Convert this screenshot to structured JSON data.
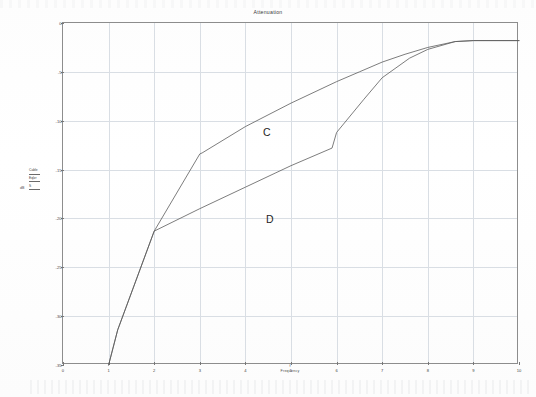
{
  "chart_data": {
    "type": "line",
    "title": "Attenuation",
    "xlabel": "Frequency",
    "xunit": "f",
    "ylabel": "dB",
    "xlim": [
      0,
      10
    ],
    "ylim": [
      -35,
      0
    ],
    "grid": true,
    "legend_position": "left-outside",
    "xticks": [
      "0",
      "1",
      "2",
      "3",
      "4",
      "5",
      "6",
      "7",
      "8",
      "9",
      "10"
    ],
    "yticks": [
      "0",
      "-5",
      "-10",
      "-15",
      "-20",
      "-25",
      "-30",
      "-35"
    ],
    "annotations": [
      {
        "text": "C",
        "x": 3.1,
        "y": -8.6
      },
      {
        "text": "D",
        "x": 3.2,
        "y": -17.2
      }
    ],
    "series": [
      {
        "name": "Cable",
        "label": "C",
        "x": [
          1.0,
          1.2,
          2.0,
          3.0,
          3.05,
          4.0,
          5.0,
          6.0,
          6.5,
          7.0,
          7.5,
          8.0,
          8.6,
          9.0,
          10.0
        ],
        "values": [
          -35.0,
          -31.4,
          -21.3,
          -13.4,
          -13.3,
          -10.6,
          -8.2,
          -6.0,
          -5.0,
          -4.0,
          -3.2,
          -2.5,
          -1.9,
          -1.8,
          -1.8
        ]
      },
      {
        "name": "Eqlzr",
        "label": "D",
        "x": [
          1.0,
          1.2,
          2.0,
          3.0,
          4.0,
          5.0,
          5.9,
          6.0,
          6.6,
          7.0,
          7.6,
          8.0,
          8.6,
          9.0,
          10.0
        ],
        "values": [
          -35.0,
          -31.4,
          -21.3,
          -19.0,
          -16.8,
          -14.6,
          -12.8,
          -11.2,
          -7.8,
          -5.6,
          -3.6,
          -2.7,
          -1.9,
          -1.8,
          -1.8
        ]
      }
    ]
  },
  "legend": {
    "entries": [
      {
        "name": "Cable"
      },
      {
        "name": "Eqlzr"
      },
      {
        "name": "S"
      }
    ]
  }
}
